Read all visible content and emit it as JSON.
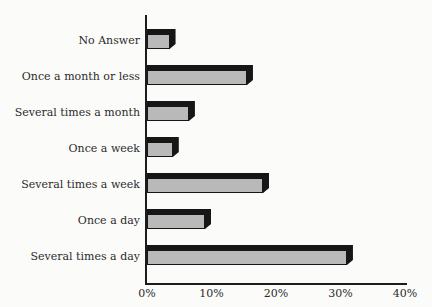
{
  "page": {
    "background": "#fbfbfa",
    "text_color": "#2b2b2b"
  },
  "chart_data": {
    "type": "bar",
    "orientation": "horizontal",
    "title": "",
    "xlabel": "",
    "ylabel": "",
    "categories": [
      "No Answer",
      "Once a month or less",
      "Several times a month",
      "Once a week",
      "Several times a week",
      "Once a day",
      "Several times a day"
    ],
    "values": [
      3.5,
      15.5,
      6.5,
      4,
      18,
      9,
      31
    ],
    "unit": "%",
    "x_ticks": [
      0,
      10,
      20,
      30,
      40
    ],
    "x_tick_labels": [
      "0%",
      "10%",
      "20%",
      "30%",
      "40%"
    ],
    "xlim": [
      0,
      40
    ],
    "grid": false,
    "legend": false,
    "data_labels": false,
    "style": {
      "bar_fill": "#b9b9b9",
      "bar_outline": "#161616",
      "bar_shadow_3d": "#161616",
      "axis_color": "#1c1c1c",
      "effect": "3d-offset-top-right"
    }
  }
}
